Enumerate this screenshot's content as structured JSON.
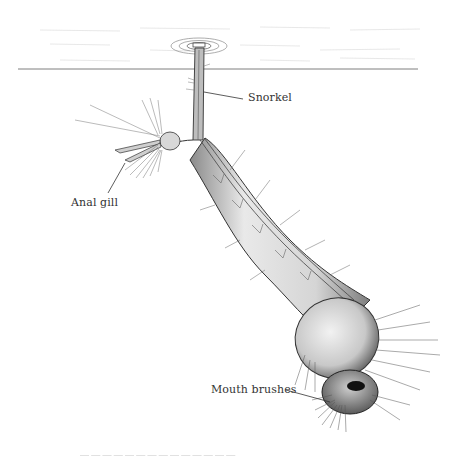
{
  "diagram": {
    "labels": {
      "snorkel": "Snorkel",
      "anal_gill": "Anal gill",
      "mouth_brushes": "Mouth brushes"
    },
    "caption": "— — —   — —   — — —   —  — —   — — —"
  },
  "colors": {
    "background": "#ffffff",
    "ink": "#333333",
    "water_line": "#6f6f6f",
    "body_shade": "#d9d9d9"
  }
}
